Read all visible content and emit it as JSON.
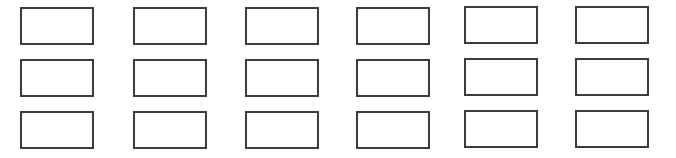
{
  "grid": {
    "rows": 3,
    "columns": 6,
    "border_color": "#3c3c3c",
    "background": "#ffffff",
    "cells": [
      {
        "row": 0,
        "col": 0
      },
      {
        "row": 0,
        "col": 1
      },
      {
        "row": 0,
        "col": 2
      },
      {
        "row": 0,
        "col": 3
      },
      {
        "row": 0,
        "col": 4
      },
      {
        "row": 0,
        "col": 5
      },
      {
        "row": 1,
        "col": 0
      },
      {
        "row": 1,
        "col": 1
      },
      {
        "row": 1,
        "col": 2
      },
      {
        "row": 1,
        "col": 3
      },
      {
        "row": 1,
        "col": 4
      },
      {
        "row": 1,
        "col": 5
      },
      {
        "row": 2,
        "col": 0
      },
      {
        "row": 2,
        "col": 1
      },
      {
        "row": 2,
        "col": 2
      },
      {
        "row": 2,
        "col": 3
      },
      {
        "row": 2,
        "col": 4
      },
      {
        "row": 2,
        "col": 5
      }
    ]
  }
}
